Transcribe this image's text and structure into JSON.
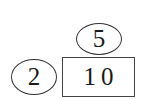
{
  "diagram": {
    "nodes": [
      {
        "id": "top",
        "shape": "ellipse",
        "label": "5"
      },
      {
        "id": "left",
        "shape": "ellipse",
        "label": "2"
      },
      {
        "id": "box",
        "shape": "rectangle",
        "label": "10"
      }
    ],
    "colors": {
      "background": "#ffffff",
      "stroke": "#333333",
      "text": "#1a1a1a"
    }
  }
}
